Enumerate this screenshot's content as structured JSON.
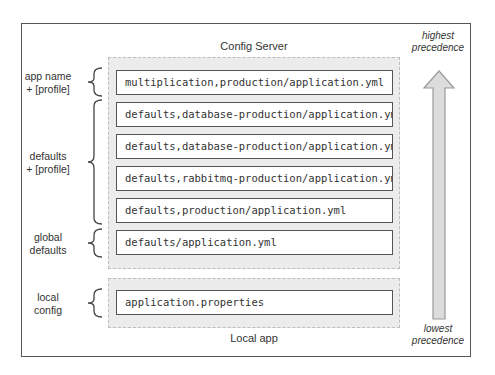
{
  "diagram": {
    "server_title": "Config Server",
    "local_title": "Local app",
    "precedence": {
      "top": "highest\nprecedence",
      "top_line1": "highest",
      "top_line2": "precedence",
      "bottom_line1": "lowest",
      "bottom_line2": "precedence"
    },
    "server_files": [
      "multiplication,production/application.yml",
      "defaults,database-production/application.yml",
      "defaults,database-production/application.yml",
      "defaults,rabbitmq-production/application.yml",
      "defaults,production/application.yml",
      "defaults/application.yml"
    ],
    "local_files": [
      "application.properties"
    ],
    "groups": [
      {
        "line1": "app name",
        "line2": "+ [profile]"
      },
      {
        "line1": "defaults",
        "line2": "+ [profile]"
      },
      {
        "line1": "global",
        "line2": "defaults"
      },
      {
        "line1": "local",
        "line2": "config"
      }
    ],
    "colors": {
      "frame": "#555555",
      "container_fill": "#ececec",
      "container_border": "#bdbdbd",
      "arrow_fill": "#dcdcdc",
      "arrow_stroke": "#9a9a9a"
    }
  }
}
